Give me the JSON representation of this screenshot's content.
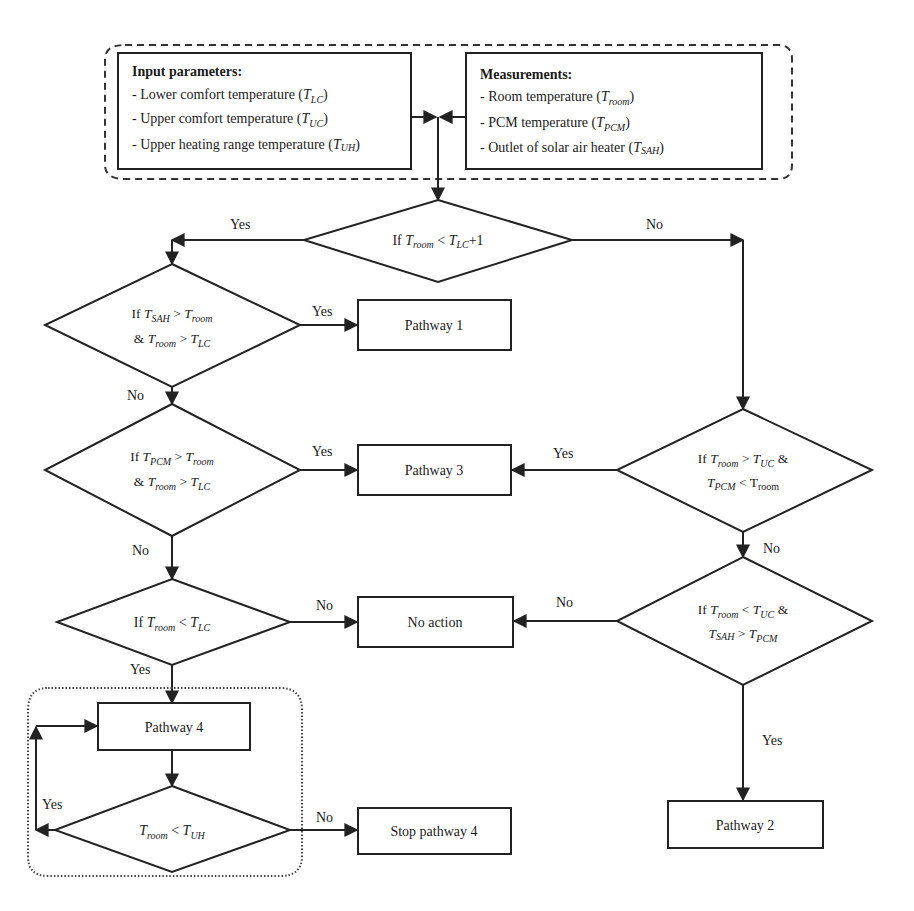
{
  "diagram": {
    "type": "flowchart",
    "colors": {
      "stroke": "#222222",
      "background": "#ffffff",
      "text": "#1a1a1a"
    },
    "input_box": {
      "title": "Input parameters:",
      "items": [
        {
          "label": "- Lower comfort temperature (",
          "symbol": "T",
          "sub": "LC",
          "close": ")"
        },
        {
          "label": "- Upper comfort temperature (",
          "symbol": "T",
          "sub": "UC",
          "close": ")"
        },
        {
          "label": "- Upper heating range temperature (",
          "symbol": "T",
          "sub": "UH",
          "close": ")"
        }
      ]
    },
    "measurement_box": {
      "title": "Measurements:",
      "items": [
        {
          "label": "- Room temperature (",
          "symbol": "T",
          "sub": "room",
          "close": ")"
        },
        {
          "label": "- PCM temperature (",
          "symbol": "T",
          "sub": "PCM",
          "close": ")"
        },
        {
          "label": "- Outlet of solar air heater (",
          "symbol": "T",
          "sub": "SAH",
          "close": ")"
        }
      ]
    },
    "decisions": {
      "d1": {
        "pre": "If ",
        "a": "T",
        "a_sub": "room",
        "op": " < ",
        "b": "T",
        "b_sub": "LC",
        "post": "+1"
      },
      "d2": {
        "line1": {
          "pre": "If ",
          "a": "T",
          "a_sub": "SAH",
          "op": " > ",
          "b": "T",
          "b_sub": "room"
        },
        "line2": {
          "pre": "& ",
          "a": "T",
          "a_sub": "room",
          "op": " > ",
          "b": "T",
          "b_sub": "LC"
        }
      },
      "d3": {
        "line1": {
          "pre": "If ",
          "a": "T",
          "a_sub": "PCM",
          "op": " > ",
          "b": "T",
          "b_sub": "room"
        },
        "line2": {
          "pre": "& ",
          "a": "T",
          "a_sub": "room",
          "op": " > ",
          "b": "T",
          "b_sub": "LC"
        }
      },
      "d4": {
        "pre": "If ",
        "a": "T",
        "a_sub": "room",
        "op": " < ",
        "b": "T",
        "b_sub": "LC"
      },
      "d5": {
        "pre": "",
        "a": "T",
        "a_sub": "room",
        "op": " < ",
        "b": "T",
        "b_sub": "UH"
      },
      "d6": {
        "line1": {
          "pre": "If ",
          "a": "T",
          "a_sub": "room",
          "op": " > ",
          "b": "T",
          "b_sub": "UC",
          "post": " &"
        },
        "line2": {
          "pre": "",
          "a": "T",
          "a_sub": "PCM",
          "op": " < ",
          "b": "T",
          "b_sub": "room",
          "b_upright": true
        }
      },
      "d7": {
        "line1": {
          "pre": "If ",
          "a": "T",
          "a_sub": "room",
          "op": " < ",
          "b": "T",
          "b_sub": "UC",
          "post": " &"
        },
        "line2": {
          "pre": "",
          "a": "T",
          "a_sub": "SAH",
          "op": " > ",
          "b": "T",
          "b_sub": "PCM"
        }
      }
    },
    "processes": {
      "pathway1": "Pathway 1",
      "pathway2": "Pathway 2",
      "pathway3": "Pathway 3",
      "pathway4": "Pathway 4",
      "no_action": "No action",
      "stop_pathway4": "Stop pathway 4"
    },
    "edge_labels": {
      "d1_yes": "Yes",
      "d1_no": "No",
      "d2_yes": "Yes",
      "d2_no": "No",
      "d3_yes": "Yes",
      "d3_no": "No",
      "d4_no": "No",
      "d4_yes": "Yes",
      "d5_yes": "Yes",
      "d5_no": "No",
      "d6_yes": "Yes",
      "d6_no": "No",
      "d7_no": "No",
      "d7_yes": "Yes"
    }
  }
}
